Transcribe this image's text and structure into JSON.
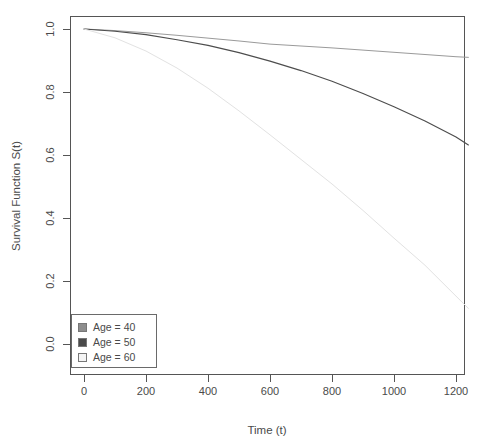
{
  "chart_data": {
    "type": "line",
    "title": "",
    "xlabel": "Time (t)",
    "ylabel": "Survival Function S(t)",
    "xlim": [
      -40,
      1290
    ],
    "ylim": [
      0.0,
      1.05
    ],
    "xticks": [
      "0",
      "200",
      "400",
      "600",
      "800",
      "1000",
      "1200"
    ],
    "xtick_values": [
      0,
      200,
      400,
      600,
      800,
      1000,
      1200
    ],
    "yticks": [
      "0.0",
      "0.2",
      "0.4",
      "0.6",
      "0.8",
      "1.0"
    ],
    "ytick_values": [
      0.0,
      0.2,
      0.4,
      0.6,
      0.8,
      1.0
    ],
    "grid": false,
    "legend_position": "bottom-left",
    "x": [
      0,
      100,
      200,
      300,
      400,
      500,
      600,
      700,
      800,
      900,
      1000,
      1100,
      1200,
      1240
    ],
    "series": [
      {
        "name": "Age = 40",
        "color": "#9a9a9a",
        "swatch_color": "#8d8d8d",
        "values": [
          1.0,
          0.995,
          0.988,
          0.98,
          0.971,
          0.962,
          0.952,
          0.946,
          0.94,
          0.933,
          0.926,
          0.919,
          0.912,
          0.91
        ]
      },
      {
        "name": "Age = 50",
        "color": "#4d4d4d",
        "swatch_color": "#4a4a4a",
        "values": [
          1.0,
          0.993,
          0.982,
          0.966,
          0.948,
          0.925,
          0.898,
          0.868,
          0.834,
          0.795,
          0.753,
          0.708,
          0.657,
          0.632
        ]
      },
      {
        "name": "Age = 60",
        "color": "#e2e2e2",
        "swatch_color": "#f4f4f4",
        "values": [
          1.0,
          0.972,
          0.93,
          0.876,
          0.812,
          0.74,
          0.664,
          0.586,
          0.508,
          0.424,
          0.336,
          0.25,
          0.152,
          0.113
        ]
      }
    ]
  },
  "legend": {
    "items": [
      {
        "label": "Age = 40"
      },
      {
        "label": "Age = 50"
      },
      {
        "label": "Age = 60"
      }
    ]
  }
}
